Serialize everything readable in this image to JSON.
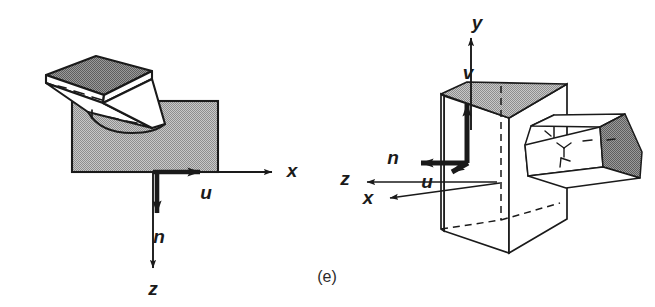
{
  "figure": {
    "caption": "(e)",
    "background_color": "#ffffff",
    "ink_color": "#1a1a1a",
    "fill_gray": "#b4b4b4",
    "fill_gray_dark": "#8c8c8c",
    "fill_white": "#ffffff"
  },
  "left_panel": {
    "name": "planar-surface-with-tilted-plate",
    "shapes": {
      "slab_label": "shaded rectangular block",
      "plate_label": "tilted thin plate"
    },
    "labels": {
      "x_axis": "x",
      "z_axis": "z",
      "normal": "n",
      "tangent": "u"
    }
  },
  "right_panel": {
    "name": "box-with-house-prism",
    "shapes": {
      "box_label": "tall rectangular box",
      "prism_label": "house-shaped prism"
    },
    "labels": {
      "y_axis": "y",
      "z_axis": "z",
      "x_axis": "x",
      "normal": "n",
      "tangent_u": "u",
      "tangent_v": "v"
    }
  }
}
